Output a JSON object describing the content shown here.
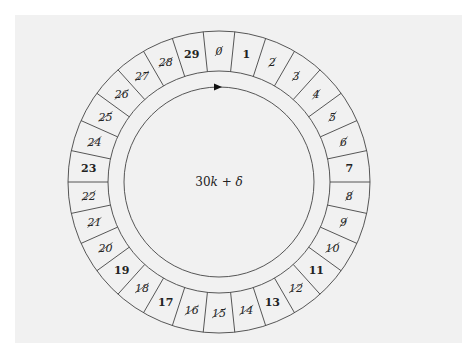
{
  "diagram": {
    "center_label": "30k + δ",
    "center_label_parts": {
      "coef": "30",
      "var": "k",
      "op": " + ",
      "delta": "δ"
    },
    "cells": [
      {
        "label": "0",
        "crossed": true
      },
      {
        "label": "1",
        "crossed": false
      },
      {
        "label": "2",
        "crossed": true
      },
      {
        "label": "3",
        "crossed": true
      },
      {
        "label": "4",
        "crossed": true
      },
      {
        "label": "5",
        "crossed": true
      },
      {
        "label": "6",
        "crossed": true
      },
      {
        "label": "7",
        "crossed": false
      },
      {
        "label": "8",
        "crossed": true
      },
      {
        "label": "9",
        "crossed": true
      },
      {
        "label": "10",
        "crossed": true
      },
      {
        "label": "11",
        "crossed": false
      },
      {
        "label": "12",
        "crossed": true
      },
      {
        "label": "13",
        "crossed": false
      },
      {
        "label": "14",
        "crossed": true
      },
      {
        "label": "15",
        "crossed": true
      },
      {
        "label": "16",
        "crossed": true
      },
      {
        "label": "17",
        "crossed": false
      },
      {
        "label": "18",
        "crossed": true
      },
      {
        "label": "19",
        "crossed": false
      },
      {
        "label": "20",
        "crossed": true
      },
      {
        "label": "21",
        "crossed": true
      },
      {
        "label": "22",
        "crossed": true
      },
      {
        "label": "23",
        "crossed": false
      },
      {
        "label": "24",
        "crossed": true
      },
      {
        "label": "25",
        "crossed": true
      },
      {
        "label": "26",
        "crossed": true
      },
      {
        "label": "27",
        "crossed": true
      },
      {
        "label": "28",
        "crossed": true
      },
      {
        "label": "29",
        "crossed": false
      }
    ],
    "arrow": {
      "direction": "clockwise",
      "icon": "arrowhead-icon"
    },
    "colors": {
      "line": "#444444",
      "text": "#222222",
      "panel": "#f1f1f1"
    }
  }
}
